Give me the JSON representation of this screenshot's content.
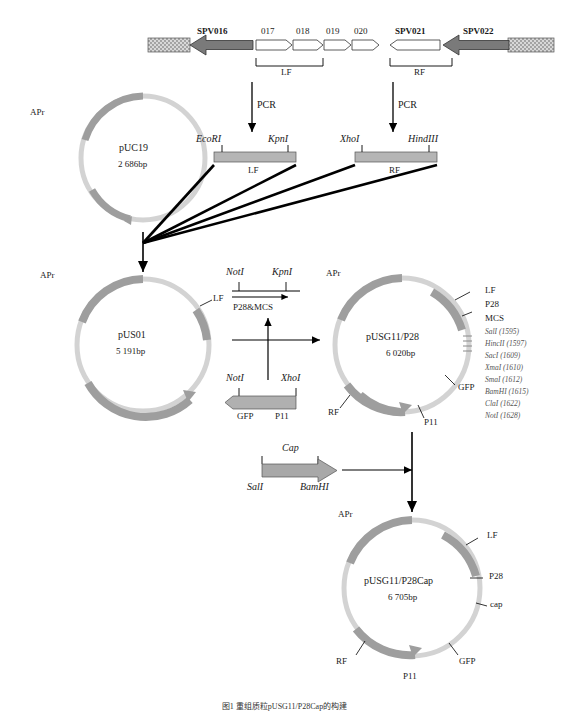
{
  "figure": {
    "caption": "图1 重组质粒pUSG11/P28Cap的构建"
  },
  "genome": {
    "genes": [
      "SPV016",
      "017",
      "018",
      "019",
      "020",
      "SPV021",
      "SPV022"
    ],
    "flanks": [
      "LF",
      "RF"
    ]
  },
  "pcr": {
    "left_label": "PCR",
    "right_label": "PCR"
  },
  "lf_fragment": {
    "left_site": "EcoRI",
    "right_site": "KpnI",
    "name": "LF"
  },
  "rf_fragment": {
    "left_site": "XhoI",
    "right_site": "HindIII",
    "name": "RF"
  },
  "puc19": {
    "name": "pUC19",
    "size": "2 686bp",
    "marker": "APr"
  },
  "pus01": {
    "name": "pUS01",
    "size": "5 191bp",
    "marker": "APr",
    "lf": "LF"
  },
  "p28mcs": {
    "left_site": "NotI",
    "right_site": "KpnI",
    "label": "P28&MCS"
  },
  "gfp_p11": {
    "left_site": "NotI",
    "right_site": "XhoI",
    "gfp": "GFP",
    "p11": "P11"
  },
  "pusg11p28": {
    "name": "pUSG11/P28",
    "size": "6 020bp",
    "marker": "APr",
    "lf": "LF",
    "p28": "P28",
    "mcs": "MCS",
    "rf": "RF",
    "gfp": "GFP",
    "p11": "P11",
    "sites": [
      "SalI (1595)",
      "HincII (1597)",
      "SacI (1609)",
      "XmaI (1610)",
      "SmaI (1612)",
      "BamHI (1615)",
      "ClaI (1622)",
      "NotI (1628)"
    ]
  },
  "cap_fragment": {
    "label": "Cap",
    "left_site": "SalI",
    "right_site": "BamHI"
  },
  "pusg11p28cap": {
    "name": "pUSG11/P28Cap",
    "size": "6 705bp",
    "marker": "APr",
    "lf": "LF",
    "p28": "P28",
    "cap": "cap",
    "rf": "RF",
    "gfp": "GFP",
    "p11": "P11"
  },
  "colors": {
    "plasmid_backbone": "#c9c9c9",
    "plasmid_segment": "#9e9e9e",
    "arrow_dark": "#4d4d4d",
    "line": "#000000"
  }
}
